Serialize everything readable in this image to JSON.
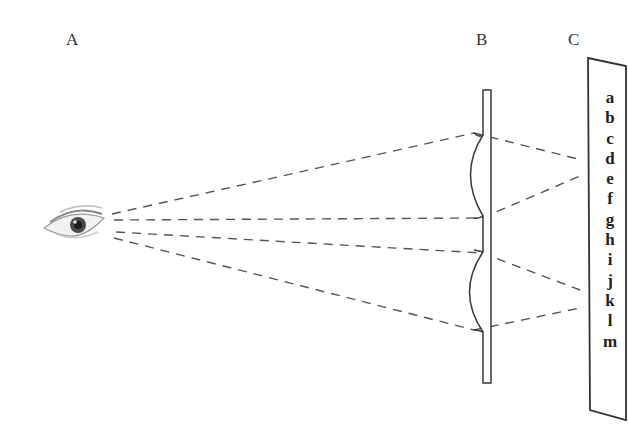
{
  "labels": {
    "eye": "A",
    "lens": "B",
    "screen": "C"
  },
  "screen_letters": [
    "a",
    "b",
    "c",
    "d",
    "e",
    "f",
    "g",
    "h",
    "i",
    "j",
    "k",
    "l",
    "m"
  ],
  "colors": {
    "line": "#444444",
    "dash": "#555555",
    "text": "#222222",
    "background": "#ffffff"
  }
}
